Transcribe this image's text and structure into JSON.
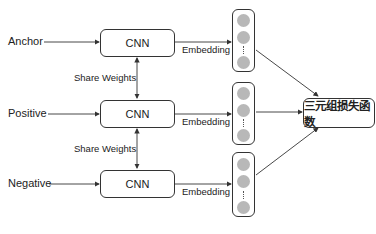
{
  "diagram": {
    "type": "triplet-network",
    "inputs": [
      {
        "label": "Anchor"
      },
      {
        "label": "Positive"
      },
      {
        "label": "Negative"
      }
    ],
    "encoders": [
      {
        "label": "CNN"
      },
      {
        "label": "CNN"
      },
      {
        "label": "CNN"
      }
    ],
    "shared_weights_labels": [
      "Share Weights",
      "Share Weights"
    ],
    "embedding_labels": [
      "Embedding",
      "Embedding",
      "Embedding"
    ],
    "vector_ellipsis": "⋮",
    "loss": {
      "label": "三元组损失函数"
    },
    "colors": {
      "stroke": "#333333",
      "node_fill": "#b8b8b8",
      "background": "#ffffff"
    }
  }
}
